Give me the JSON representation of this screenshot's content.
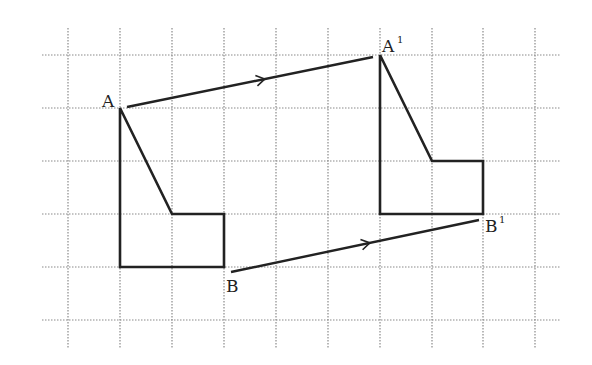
{
  "diagram": {
    "type": "translation",
    "grid": {
      "vertical_x": [
        68,
        120,
        172,
        224,
        276,
        328,
        380,
        432,
        483,
        535
      ],
      "vertical_y_range": [
        28,
        348
      ],
      "horizontal_y": [
        55,
        108,
        161,
        214,
        267,
        320
      ],
      "horizontal_x_range": [
        42,
        560
      ],
      "color": "#8a8a8a"
    },
    "original_shape": {
      "points": [
        [
          120,
          108
        ],
        [
          120,
          267
        ],
        [
          224,
          267
        ],
        [
          224,
          214
        ],
        [
          172,
          214
        ]
      ],
      "label_A": "A",
      "label_B": "B"
    },
    "image_shape": {
      "points": [
        [
          380,
          55
        ],
        [
          380,
          214
        ],
        [
          483,
          214
        ],
        [
          483,
          161
        ],
        [
          432,
          161
        ]
      ],
      "label_A": "A",
      "label_A_prime": "1",
      "label_B": "B",
      "label_B_prime": "1"
    },
    "vectors": [
      {
        "from": [
          127,
          107
        ],
        "to": [
          373,
          57
        ],
        "name": "A to A'"
      },
      {
        "from": [
          231,
          272
        ],
        "to": [
          479,
          220
        ],
        "name": "B to B'"
      }
    ],
    "stroke_color": "#222222"
  }
}
